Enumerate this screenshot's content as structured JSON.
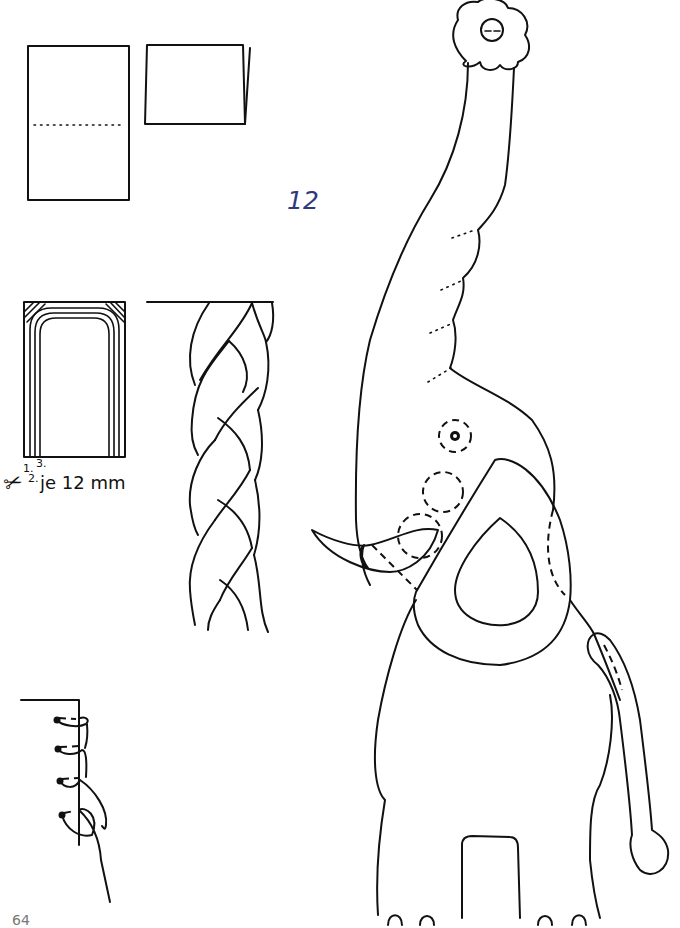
{
  "document": {
    "type": "craft-instruction-page",
    "step_number": "12",
    "step_number_color": "#2e3a7a",
    "page_number": "64"
  },
  "figures": {
    "paper_fold": {
      "description": "Rectangle with dotted fold line, then folded card",
      "fold_line_style": "dotted"
    },
    "cutting_template": {
      "strip_labels": [
        "1.",
        "2.",
        "3."
      ],
      "measure_text": "je 12 mm",
      "icon": "scissors-icon"
    },
    "braid": {
      "description": "Three-strand braid hanging from a horizontal line"
    },
    "stitching": {
      "description": "Whip stitch / overcast stitch sequence along an edge",
      "stitch_count": 4
    },
    "elephant": {
      "description": "Elephant template with raised trunk holding a flower, dashed placement lines for ear, tusk, tail, eye and cheek"
    }
  }
}
